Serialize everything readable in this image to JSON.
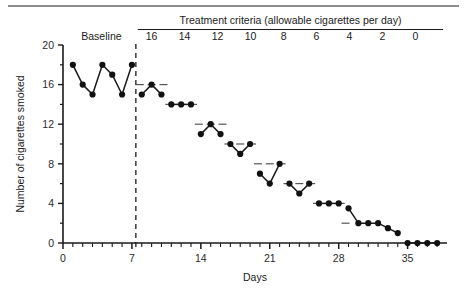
{
  "figure": {
    "phase_baseline_label": "Baseline",
    "criteria_header": "Treatment criteria (allowable cigarettes per day)",
    "criteria_values": [
      "16",
      "14",
      "12",
      "10",
      "8",
      "6",
      "4",
      "2",
      "0"
    ]
  },
  "chart_data": {
    "type": "line",
    "title": "",
    "subtitle": "",
    "xlabel": "Days",
    "ylabel": "Number of cigarettes smoked",
    "xlim": [
      0,
      39
    ],
    "ylim": [
      0,
      20
    ],
    "xticks": [
      0,
      7,
      14,
      21,
      28,
      35
    ],
    "xticklabels": [
      "0",
      "7",
      "14",
      "21",
      "28",
      "35"
    ],
    "yticks": [
      0,
      4,
      8,
      12,
      16,
      20
    ],
    "yticklabels": [
      "0",
      "4",
      "8",
      "12",
      "16",
      "20"
    ],
    "minor_xtick_interval": 1,
    "minor_ytick_interval": 2,
    "grid": false,
    "legend": false,
    "marker": "filled-circle",
    "phase_change_x": 7.4,
    "phase_change_style": "dashed-vertical",
    "series": [
      {
        "name": "Baseline",
        "x": [
          1,
          2,
          3,
          4,
          5,
          6,
          7
        ],
        "values": [
          18,
          16,
          15,
          18,
          17,
          15,
          18
        ]
      },
      {
        "name": "Treatment criterion 16",
        "x": [
          8,
          9,
          10
        ],
        "values": [
          15,
          16,
          15
        ]
      },
      {
        "name": "Treatment criterion 14",
        "x": [
          11,
          12,
          13
        ],
        "values": [
          14,
          14,
          14
        ]
      },
      {
        "name": "Treatment criterion 12",
        "x": [
          14,
          15,
          16
        ],
        "values": [
          11,
          12,
          11
        ]
      },
      {
        "name": "Treatment criterion 10",
        "x": [
          17,
          18,
          19
        ],
        "values": [
          10,
          9,
          10
        ]
      },
      {
        "name": "Treatment criterion 8",
        "x": [
          20,
          21,
          22
        ],
        "values": [
          7,
          6,
          8
        ]
      },
      {
        "name": "Treatment criterion 6",
        "x": [
          23,
          24,
          25
        ],
        "values": [
          6,
          5,
          6
        ]
      },
      {
        "name": "Treatment criterion 4",
        "x": [
          26,
          27,
          28
        ],
        "values": [
          4,
          4,
          4
        ]
      },
      {
        "name": "Treatment criterion 2",
        "x": [
          29,
          30,
          31,
          32,
          33,
          34
        ],
        "values": [
          3.5,
          2,
          2,
          2,
          1.5,
          1
        ]
      },
      {
        "name": "Treatment criterion 0",
        "x": [
          35,
          36,
          37,
          38
        ],
        "values": [
          0,
          0,
          0,
          0
        ]
      }
    ],
    "criterion_levels": [
      {
        "label": "16",
        "value": 16,
        "x_start": 8,
        "x_end": 10
      },
      {
        "label": "14",
        "value": 14,
        "x_start": 11,
        "x_end": 13
      },
      {
        "label": "12",
        "value": 12,
        "x_start": 14,
        "x_end": 16
      },
      {
        "label": "10",
        "value": 10,
        "x_start": 17,
        "x_end": 19
      },
      {
        "label": "8",
        "value": 8,
        "x_start": 20,
        "x_end": 22
      },
      {
        "label": "6",
        "value": 6,
        "x_start": 23,
        "x_end": 25
      },
      {
        "label": "4",
        "value": 4,
        "x_start": 26,
        "x_end": 28
      },
      {
        "label": "2",
        "value": 2,
        "x_start": 29,
        "x_end": 31
      },
      {
        "label": "0",
        "value": 0,
        "x_start": 32,
        "x_end": 34
      }
    ]
  }
}
